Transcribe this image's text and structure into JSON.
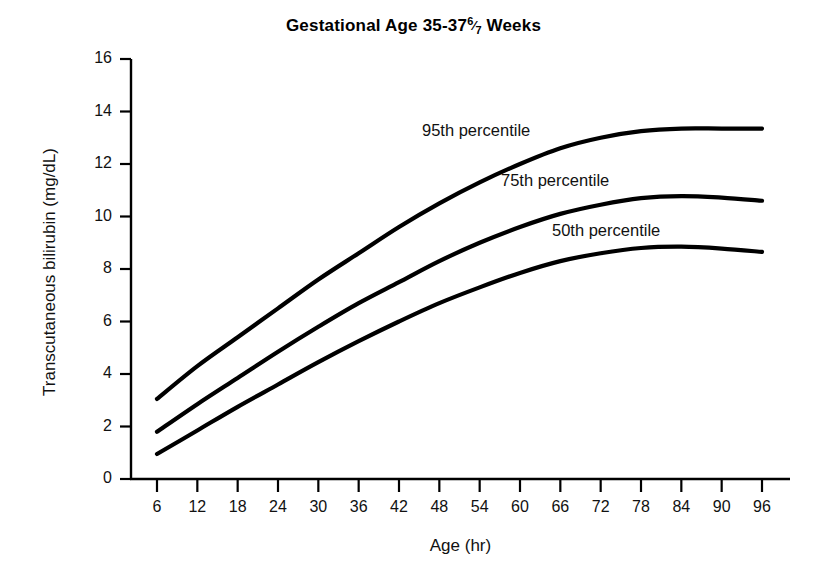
{
  "chart_data": {
    "type": "line",
    "title_prefix": "Gestational Age 35-37",
    "title_fraction_numerator": "6",
    "title_fraction_denominator": "7",
    "title_suffix": "Weeks",
    "xlabel": "Age (hr)",
    "ylabel": "Transcutaneous bilirubin (mg/dL)",
    "xlim": [
      0,
      102
    ],
    "ylim": [
      0,
      16
    ],
    "x_ticks": [
      6,
      12,
      18,
      24,
      30,
      36,
      42,
      48,
      54,
      60,
      66,
      72,
      78,
      84,
      90,
      96
    ],
    "y_ticks": [
      0,
      2,
      4,
      6,
      8,
      10,
      12,
      14,
      16
    ],
    "grid": false,
    "legend_position": "inline-annotations",
    "line_color": "#000000",
    "x": [
      6,
      12,
      18,
      24,
      30,
      36,
      42,
      48,
      54,
      60,
      66,
      72,
      78,
      84,
      90,
      96
    ],
    "series": [
      {
        "name": "95th percentile",
        "label": "95th percentile",
        "values": [
          3.05,
          4.3,
          5.4,
          6.5,
          7.6,
          8.6,
          9.6,
          10.5,
          11.3,
          12.0,
          12.6,
          13.0,
          13.25,
          13.35,
          13.35,
          13.35
        ]
      },
      {
        "name": "75th percentile",
        "label": "75th percentile",
        "values": [
          1.8,
          2.85,
          3.85,
          4.85,
          5.8,
          6.7,
          7.5,
          8.3,
          9.0,
          9.6,
          10.1,
          10.45,
          10.7,
          10.78,
          10.72,
          10.6
        ]
      },
      {
        "name": "50th percentile",
        "label": "50th percentile",
        "values": [
          0.95,
          1.85,
          2.75,
          3.6,
          4.45,
          5.25,
          6.0,
          6.7,
          7.3,
          7.85,
          8.3,
          8.6,
          8.8,
          8.85,
          8.78,
          8.65
        ]
      }
    ],
    "annotations": [
      {
        "text": "95th percentile",
        "x_px": 422,
        "y_px": 121
      },
      {
        "text": "75th percentile",
        "x_px": 501,
        "y_px": 171
      },
      {
        "text": "50th percentile",
        "x_px": 552,
        "y_px": 221
      }
    ]
  }
}
